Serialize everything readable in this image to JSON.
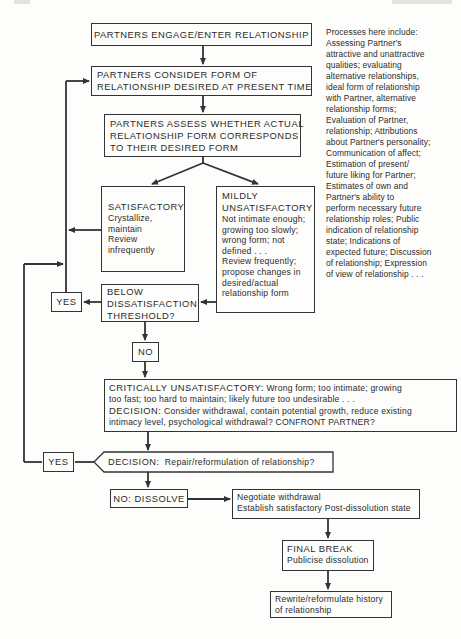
{
  "diagram": {
    "type": "flowchart",
    "colors": {
      "line": "#333333",
      "text": "#2b2b2b",
      "background": "#fdfdfb"
    },
    "nodes": {
      "engage": {
        "text": "PARTNERS ENGAGE/ENTER RELATIONSHIP"
      },
      "consider": {
        "lines": [
          "PARTNERS CONSIDER FORM OF",
          "RELATIONSHIP DESIRED AT PRESENT TIME"
        ]
      },
      "assess": {
        "lines": [
          "PARTNERS ASSESS WHETHER ACTUAL",
          "RELATIONSHIP FORM CORRESPONDS",
          "TO THEIR DESIRED FORM"
        ]
      },
      "satisfactory": {
        "title": "SATISFACTORY",
        "lines": [
          "Crystallize,",
          "maintain",
          "Review",
          "infrequently"
        ]
      },
      "mildly": {
        "title_lines": [
          "MILDLY",
          "UNSATISFACTORY"
        ],
        "lines": [
          "Not intimate enough;",
          "growing too slowly;",
          "wrong form;  not",
          "defined . . .",
          "Review frequently;",
          "propose changes in",
          "desired/actual",
          "relationship form"
        ]
      },
      "threshold": {
        "lines": [
          "BELOW",
          "DISSATISFACTION",
          "THRESHOLD?"
        ]
      },
      "yes_upper": {
        "text": "YES"
      },
      "no_upper": {
        "text": "NO"
      },
      "critical": {
        "title": "CRITICALLY UNSATISFACTORY:",
        "lines": [
          "Wrong form;  too intimate;  growing",
          "too fast;  too hard to maintain;  likely future too undesirable . . .",
          "Consider withdrawal, contain potential growth, reduce existing",
          "intimacy level, psychological withdrawal?  CONFRONT PARTNER?"
        ],
        "decision_label": "DECISION:"
      },
      "repair_decision": {
        "label": "DECISION:",
        "text": "Repair/reformulation of relationship?"
      },
      "yes_lower": {
        "text": "YES"
      },
      "dissolve": {
        "text": "NO:  DISSOLVE"
      },
      "negotiate": {
        "lines": [
          "Negotiate withdrawal",
          "Establish satisfactory Post-dissolution state"
        ]
      },
      "final_break": {
        "title": "FINAL BREAK",
        "lines": [
          "Publicise dissolution"
        ]
      },
      "rewrite": {
        "lines": [
          "Rewrite/reformulate history",
          "of relationship"
        ]
      }
    },
    "edges": [
      [
        "engage",
        "consider"
      ],
      [
        "consider",
        "assess"
      ],
      [
        "assess",
        "satisfactory"
      ],
      [
        "assess",
        "mildly"
      ],
      [
        "satisfactory",
        "consider"
      ],
      [
        "mildly",
        "threshold"
      ],
      [
        "threshold",
        "yes_upper"
      ],
      [
        "yes_upper",
        "consider"
      ],
      [
        "threshold",
        "no_upper"
      ],
      [
        "no_upper",
        "critical"
      ],
      [
        "critical",
        "repair_decision"
      ],
      [
        "repair_decision",
        "yes_lower"
      ],
      [
        "yes_lower",
        "consider"
      ],
      [
        "repair_decision",
        "dissolve"
      ],
      [
        "dissolve",
        "negotiate"
      ],
      [
        "negotiate",
        "final_break"
      ],
      [
        "final_break",
        "rewrite"
      ]
    ],
    "side_note": {
      "lines": [
        "Processes here include:",
        "Assessing Partner's",
        "attractive and unattractive",
        "qualities;  evaluating",
        "alternative relationships,",
        "ideal form of relationship",
        "with Partner, alternative",
        "relationship forms;",
        "Evaluation of Partner,",
        "relationship;  Attributions",
        "about Partner's personality;",
        "Communication of affect;",
        "Estimation of present/",
        "future liking for Partner;",
        "Estimates of own and",
        "Partner's ability to",
        "perform necessary future",
        "relationship roles;  Public",
        "indication of relationship",
        "state;  Indications of",
        "expected future;  Discussion",
        "of relationship;  Expression",
        "of view of relationship . . ."
      ]
    }
  }
}
